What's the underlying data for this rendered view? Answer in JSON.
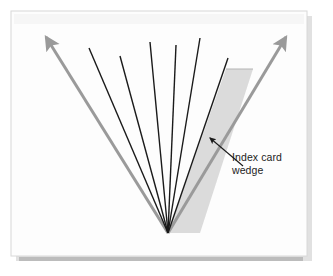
{
  "figure": {
    "background_color": "#ffffff",
    "panel": {
      "fill": "#fdfdfd",
      "border_color": "#d8d8d8",
      "shadow_color": "#c9c9c9",
      "x": 11,
      "y": 11,
      "width": 296,
      "height": 245
    },
    "annotations": {
      "wedge_label": {
        "text": "Index card\nwedge",
        "line1": "Index card",
        "line2": "wedge",
        "color": "#1c1c1c",
        "font_size_px": 10.5,
        "x": 232,
        "y": 151
      }
    },
    "vertex": {
      "x": 168,
      "y": 233
    },
    "arrows": {
      "color": "#9a9a9a",
      "stroke_width": 3,
      "left": {
        "name": "left-boundary-arrow",
        "from_x": 168,
        "from_y": 233,
        "to_x": 44,
        "to_y": 35,
        "arrowhead": "up-left"
      },
      "right": {
        "name": "right-boundary-arrow",
        "from_x": 168,
        "from_y": 233,
        "to_x": 288,
        "to_y": 35,
        "arrowhead": "up-right"
      }
    },
    "fan_lines": {
      "color": "#1a1a1a",
      "stroke_width": 1.4,
      "count": 6,
      "tops": [
        {
          "x": 89,
          "y": 48
        },
        {
          "x": 120,
          "y": 56
        },
        {
          "x": 150,
          "y": 42
        },
        {
          "x": 176,
          "y": 45
        },
        {
          "x": 200,
          "y": 38
        },
        {
          "x": 228,
          "y": 58
        }
      ]
    },
    "wedge": {
      "name": "index-card-wedge",
      "fill": "#d5d5d5",
      "opacity": 0.85,
      "points": "168,233 226,69 253,69 200,233",
      "top_edge_y": 69,
      "top_left_x": 226,
      "top_right_x": 253
    },
    "pointer": {
      "name": "wedge-pointer-arrow",
      "color": "#1a1a1a",
      "stroke_width": 1.1,
      "from_x": 243,
      "from_y": 166,
      "to_x": 208,
      "to_y": 136,
      "arrowhead": "up-left"
    }
  }
}
